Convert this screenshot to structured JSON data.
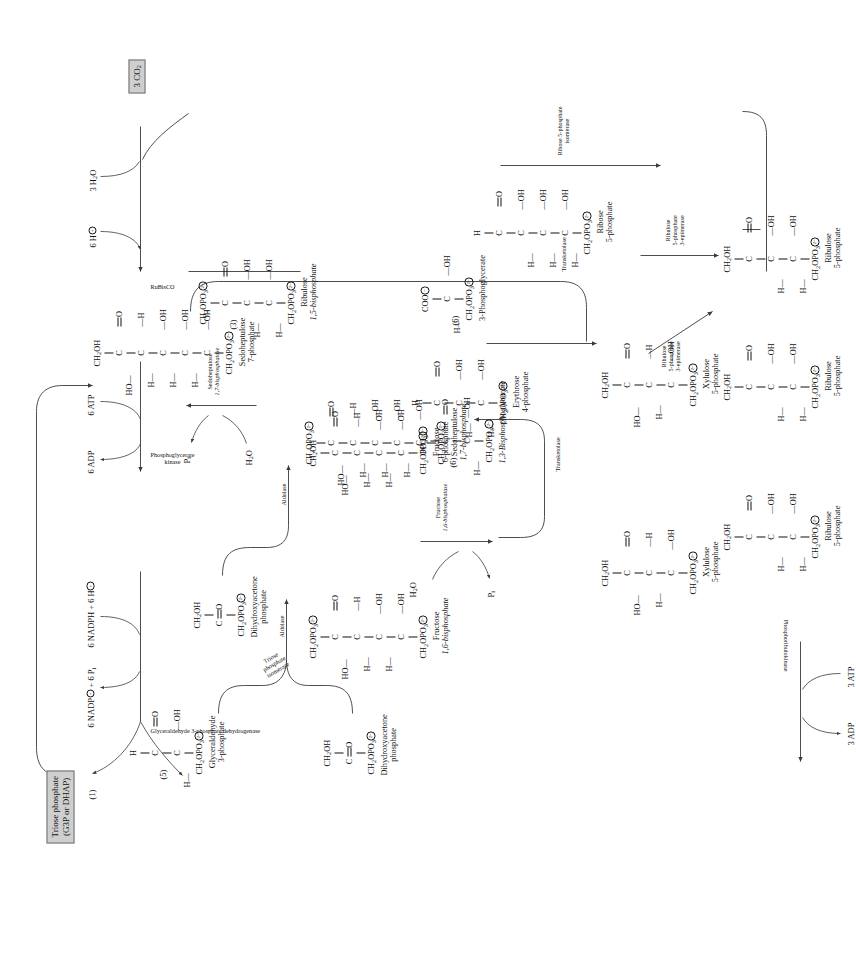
{
  "diagram": {
    "inputs": {
      "co2": "3 CO2",
      "water": "3 H2O",
      "protons": "6 H"
    },
    "output": {
      "product_line1": "Triose phosphate",
      "product_line2": "(G3P or DHAP)"
    },
    "cofactors": {
      "nadph_in": "6 NADPH + 6 H",
      "nadp_out": "6 NADP",
      "pi_out": "+ 6 P",
      "atp_6": "6 ATP",
      "adp_6": "6 ADP",
      "atp_3": "3 ATP",
      "adp_3": "3 ADP",
      "h2o": "H2O",
      "pi": "P"
    },
    "enzymes": [
      "RuBisCO",
      "Phosphoglycerate kinase",
      "Glyceraldehyde 3-phosphate dehydrogenase",
      "Triose phosphate isomerase",
      "Aldolase",
      "Fructose 1,6-bisphosphatase",
      "Transketolase",
      "Sedoheptulose 1,7-bisphosphatase",
      "Ribose 5-phosphate isomerase",
      "Ribulose 5-phosphate 3-epimerase",
      "Phosphoribulokinase"
    ],
    "enzyme_labels": {
      "rubisco": "RuBisCO",
      "pgk_l1": "Phosphoglycerate",
      "pgk_l2": "kinase",
      "gapdh": "Glyceraldehyde 3-phosphate dehydrogenase",
      "tpi_l1": "Triose",
      "tpi_l2": "phosphate",
      "tpi_l3": "isomerase",
      "aldolase": "Aldolase",
      "fbpase_l1": "Fructose",
      "fbpase_l2": "1,6-bisphosphatase",
      "transketolase": "Transketolase",
      "sbpase_l1": "Sedoheptulose",
      "sbpase_l2": "1,7-bisphosphatase",
      "r5pi_l1": "Ribose 5-phosphate",
      "r5pi_l2": "isomerase",
      "rpe_l1": "Ribulose",
      "rpe_l2": "5-phosphate",
      "rpe_l3": "3-epimerase",
      "prk": "Phosphoribulokinase"
    },
    "stoichiometry": {
      "rubp": "(3)",
      "pga": "(6)",
      "bpg": "(6)",
      "g3p": "(5)",
      "triose_out": "(1)"
    },
    "metabolites": [
      {
        "id": "rubp",
        "name_l1": "Ribulose",
        "name_l2": "1,5-bisphosphate",
        "carbons": 5
      },
      {
        "id": "pga",
        "name_l1": "3-Phosphoglycerate",
        "name_l2": "",
        "carbons": 3
      },
      {
        "id": "bpg",
        "name_l1": "1,3-Bisphosphoglycerate",
        "name_l2": "",
        "carbons": 3
      },
      {
        "id": "g3p",
        "name_l1": "Glyceraldehyde",
        "name_l2": "3-phosphate",
        "carbons": 3
      },
      {
        "id": "dhap1",
        "name_l1": "Dihydroxyacetone",
        "name_l2": "phosphate",
        "carbons": 3
      },
      {
        "id": "dhap2",
        "name_l1": "Dihydroxyacetone",
        "name_l2": "phosphate",
        "carbons": 3
      },
      {
        "id": "fbp",
        "name_l1": "Fructose",
        "name_l2": "1,6-bisphosphate",
        "carbons": 6
      },
      {
        "id": "f6p",
        "name_l1": "Fructose",
        "name_l2": "6-phosphate",
        "carbons": 6
      },
      {
        "id": "e4p",
        "name_l1": "Erythrose",
        "name_l2": "4-phosphate",
        "carbons": 4
      },
      {
        "id": "sbp",
        "name_l1": "Sedoheptulose",
        "name_l2": "1,7-bisphosphate",
        "carbons": 7
      },
      {
        "id": "s7p",
        "name_l1": "Sedoheptulose",
        "name_l2": "7-phosphate",
        "carbons": 7
      },
      {
        "id": "xu5p_a",
        "name_l1": "Xylulose",
        "name_l2": "5-phosphate",
        "carbons": 5
      },
      {
        "id": "xu5p_b",
        "name_l1": "Xylulose",
        "name_l2": "5-phosphate",
        "carbons": 5
      },
      {
        "id": "r5p",
        "name_l1": "Ribose",
        "name_l2": "5-phosphate",
        "carbons": 5
      },
      {
        "id": "ru5p_a",
        "name_l1": "Ribulose",
        "name_l2": "5-phosphate",
        "carbons": 5
      },
      {
        "id": "ru5p_b",
        "name_l1": "Ribulose",
        "name_l2": "5-phosphate",
        "carbons": 5
      },
      {
        "id": "ru5p_c",
        "name_l1": "Ribulose",
        "name_l2": "5-phosphate",
        "carbons": 5
      }
    ],
    "colors": {
      "box_fill": "#cfcfcf",
      "box_stroke": "#6f6f6f",
      "ink": "#111111",
      "line": "#3a3a3a"
    }
  }
}
